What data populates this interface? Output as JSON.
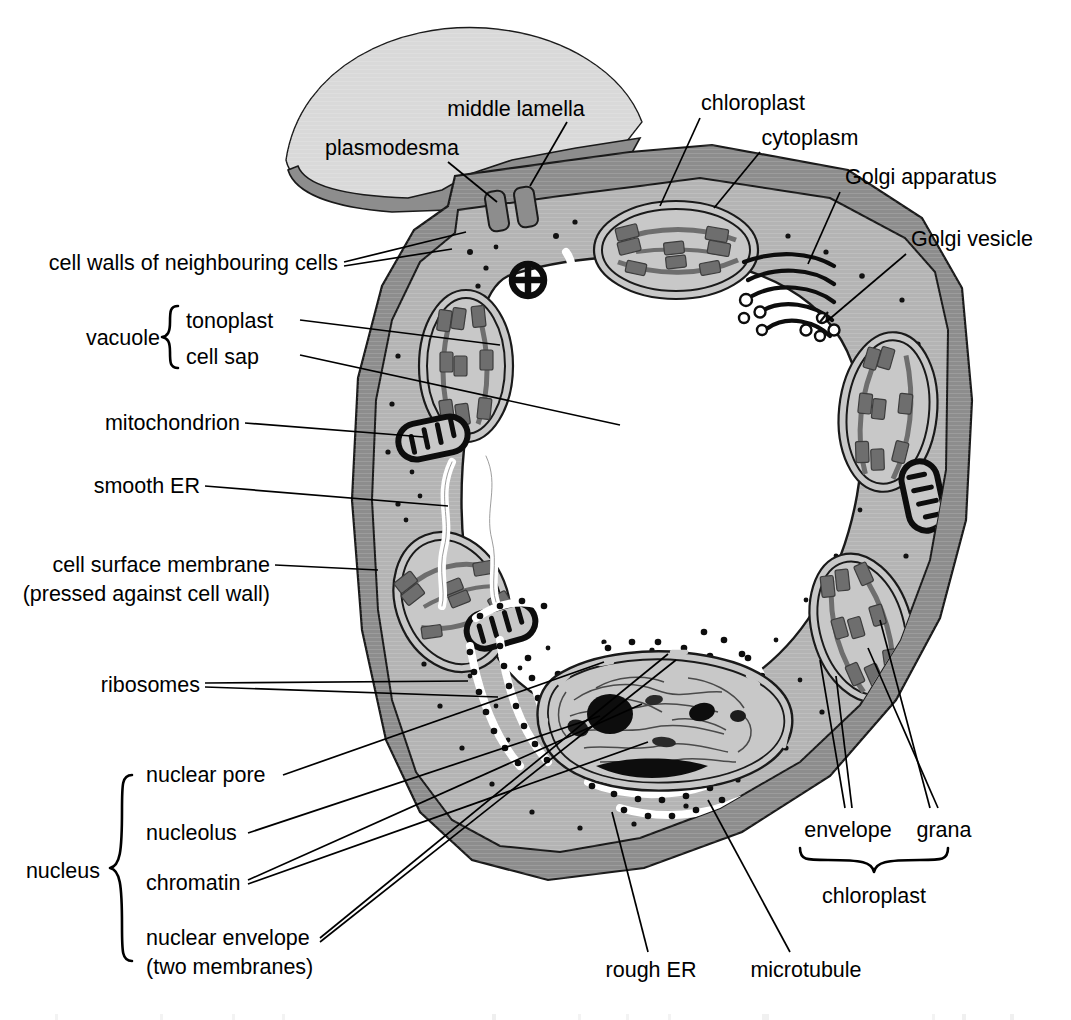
{
  "figure": {
    "kind": "labelled biological diagram"
  },
  "colors": {
    "background": "#ffffff",
    "cell_wall": "#8d8d8d",
    "cytoplasm": "#b4b4b4",
    "organelle_fill": "#c8c8c8",
    "neighbour_cell": "#d9d9d9",
    "vacuole": "#ffffff",
    "outline": "#1a1a1a",
    "grana_dark": "#6e6e6e",
    "ink": "#000000"
  },
  "labels": {
    "middle_lamella": "middle lamella",
    "plasmodesma": "plasmodesma",
    "chloroplast_top": "chloroplast",
    "cytoplasm": "cytoplasm",
    "golgi_apparatus": "Golgi apparatus",
    "golgi_vesicle": "Golgi vesicle",
    "cell_walls_neighbouring": "cell walls of neighbouring cells",
    "vacuole": "vacuole",
    "tonoplast": "tonoplast",
    "cell_sap": "cell sap",
    "mitochondrion": "mitochondrion",
    "smooth_er": "smooth ER",
    "cell_surface_membrane_l1": "cell surface membrane",
    "cell_surface_membrane_l2": "(pressed against cell wall)",
    "ribosomes": "ribosomes",
    "nucleus": "nucleus",
    "nuclear_pore": "nuclear pore",
    "nucleolus": "nucleolus",
    "chromatin": "chromatin",
    "nuclear_envelope_l1": "nuclear envelope",
    "nuclear_envelope_l2": "(two membranes)",
    "rough_er": "rough ER",
    "microtubule": "microtubule",
    "envelope": "envelope",
    "grana": "grana",
    "chloroplast_bracket": "chloroplast"
  },
  "groups": {
    "vacuole_parts": [
      "tonoplast",
      "cell sap"
    ],
    "nucleus_parts": [
      "nuclear pore",
      "nucleolus",
      "chromatin",
      "nuclear envelope (two membranes)"
    ],
    "chloroplast_parts": [
      "envelope",
      "grana"
    ]
  }
}
